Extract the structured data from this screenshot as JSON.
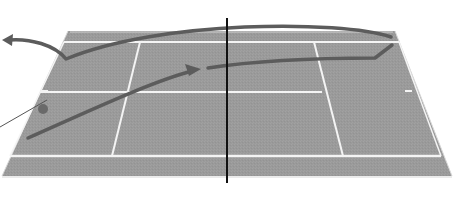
{
  "diagram": {
    "title": "Tennis court shot trajectory diagram",
    "colors": {
      "background": "#ffffff",
      "court_surface": "#9a9a9a",
      "court_lines": "#f4f4f4",
      "net": "#111111",
      "trajectory": "#5c5c5c",
      "ball": "#6a6a6a",
      "pointer_line": "#555555"
    },
    "court": {
      "outer_polygon": [
        [
          68,
          31
        ],
        [
          395,
          31
        ],
        [
          452,
          176
        ],
        [
          2,
          176
        ]
      ],
      "far_baseline_y": 42,
      "service_line_far_y": 92,
      "near_baseline_y": 156,
      "net_x": 227,
      "net_top_y": 18,
      "net_bottom_y": 183
    },
    "elements": [
      {
        "name": "court-surface",
        "type": "polygon"
      },
      {
        "name": "net",
        "type": "line"
      },
      {
        "name": "ball",
        "type": "circle",
        "cx": 43,
        "cy": 109,
        "r": 5
      },
      {
        "name": "trajectory-cross-court",
        "type": "arrow",
        "direction": "toward left edge"
      },
      {
        "name": "trajectory-down-line",
        "type": "arrow",
        "direction": "toward center"
      }
    ]
  }
}
